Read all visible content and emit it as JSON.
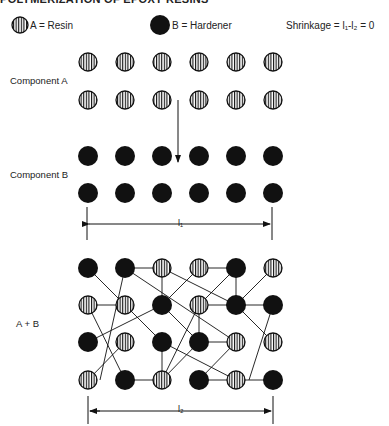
{
  "title": "POLYMERIZATION OF EPOXY RESINS",
  "legend": {
    "resin": {
      "symbol": "striped-circle",
      "label": "A = Resin"
    },
    "hardener": {
      "symbol": "filled-circle",
      "label": "B = Hardener"
    },
    "formula": "Shrinkage = l₁-l₂ = 0"
  },
  "sections": {
    "component_a": {
      "label": "Component A",
      "rows": [
        [
          "A",
          "A",
          "A",
          "A",
          "A",
          "A"
        ],
        [
          "A",
          "A",
          "A",
          "A",
          "A",
          "A"
        ]
      ]
    },
    "component_b": {
      "label": "Component B",
      "rows": [
        [
          "B",
          "B",
          "B",
          "B",
          "B",
          "B"
        ],
        [
          "B",
          "B",
          "B",
          "B",
          "B",
          "B"
        ]
      ]
    },
    "mixture": {
      "label": "A + B",
      "rows": [
        [
          "B",
          "B",
          "A",
          "A",
          "B",
          "A"
        ],
        [
          "A",
          "A",
          "B",
          "A",
          "B",
          "B"
        ],
        [
          "B",
          "A",
          "B",
          "B",
          "A",
          "A"
        ],
        [
          "A",
          "B",
          "A",
          "B",
          "A",
          "B"
        ]
      ]
    }
  },
  "dimensions": {
    "before": "l₁",
    "after": "l₂"
  },
  "colors": {
    "ink": "#111111",
    "background": "#ffffff"
  }
}
